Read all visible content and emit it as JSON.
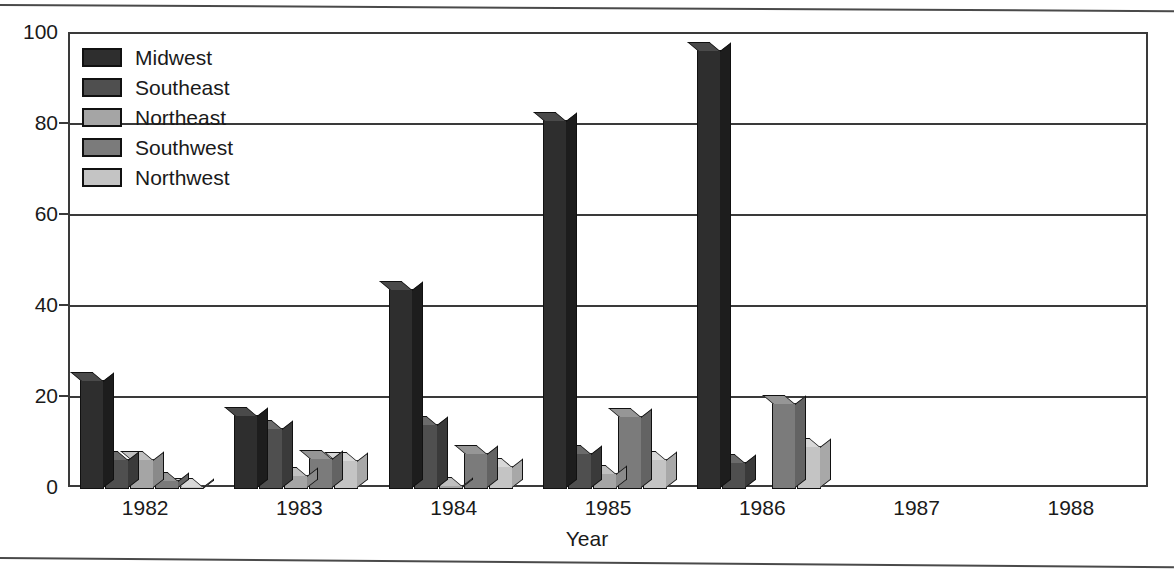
{
  "chart_data": {
    "type": "bar",
    "title": "",
    "xlabel": "Year",
    "ylabel": "",
    "categories": [
      "1982",
      "1983",
      "1984",
      "1985",
      "1986",
      "1987",
      "1988"
    ],
    "ylim": [
      0,
      100
    ],
    "yticks": [
      0,
      20,
      40,
      60,
      80,
      100
    ],
    "ytick_labels": [
      "0",
      "20",
      "40",
      "60",
      "80",
      "100"
    ],
    "grid": true,
    "grid_axis": "y",
    "legend_position": "upper-left-inside",
    "style": "3d-bars-grayscale",
    "series": [
      {
        "name": "Midwest",
        "color": "#2e2e2e",
        "side_color": "#1d1d1d",
        "top_color": "#4a4a4a",
        "values": [
          24,
          16.3,
          44,
          81,
          96.5,
          0,
          0
        ]
      },
      {
        "name": "Southeast",
        "color": "#4f4f4f",
        "side_color": "#3a3a3a",
        "top_color": "#6b6b6b",
        "values": [
          6.5,
          13.3,
          14.2,
          8,
          6,
          0,
          0
        ]
      },
      {
        "name": "Northeast",
        "color": "#a5a5a5",
        "side_color": "#8a8a8a",
        "top_color": "#c0c0c0",
        "values": [
          6.5,
          3,
          0.8,
          3.5,
          0,
          0,
          0
        ]
      },
      {
        "name": "Southwest",
        "color": "#7b7b7b",
        "side_color": "#636363",
        "top_color": "#969696",
        "values": [
          2,
          6.8,
          8,
          16,
          19,
          0,
          0
        ]
      },
      {
        "name": "Northwest",
        "color": "#c4c4c4",
        "side_color": "#a8a8a8",
        "top_color": "#d8d8d8",
        "values": [
          0.7,
          6.3,
          5,
          6.5,
          9.5,
          0,
          0
        ]
      }
    ]
  },
  "legend": {
    "items": [
      {
        "label": "Midwest"
      },
      {
        "label": "Southeast"
      },
      {
        "label": "Northeast"
      },
      {
        "label": "Southwest"
      },
      {
        "label": "Northwest"
      }
    ]
  },
  "axis": {
    "x_title": "Year"
  }
}
